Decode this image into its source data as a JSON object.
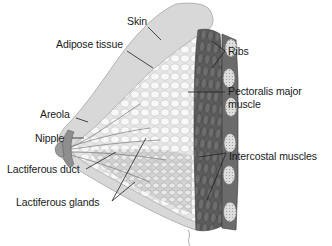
{
  "diagram": {
    "labels": {
      "skin": "Skin",
      "adipose": "Adipose tissue",
      "ribs": "Ribs",
      "pectoralis_line1": "Pectoralis major",
      "pectoralis_line2": "muscle",
      "areola": "Areola",
      "nipple": "Nipple",
      "lactiferous_duct": "Lactiferous duct",
      "intercostal": "Intercostal muscles",
      "lactiferous_glands": "Lactiferous glands"
    },
    "colors": {
      "skin": "#d9d9d9",
      "skin_edge": "#a8a8a8",
      "adipose": "#ececec",
      "adipose_lobule": "#f7f7f7",
      "muscle": "#5f5f5f",
      "muscle_dark": "#3e3e3e",
      "rib": "#d0d0d0",
      "areola": "#8a8a8a",
      "leader": "#222222",
      "text": "#1a1a1a"
    }
  }
}
